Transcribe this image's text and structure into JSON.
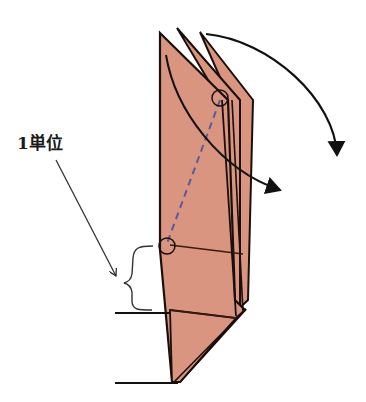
{
  "diagram": {
    "label_unit": "1単位",
    "colors": {
      "paper_fill": "#d99580",
      "paper_stroke": "#1a0f0c",
      "dashed_line": "#5a5a9a",
      "arrow": "#111111",
      "background": "#ffffff"
    },
    "elements": [
      "three folded paper flaps (layered)",
      "curved fold arrow from top flap to right",
      "curved fold arrow crossing flaps",
      "dashed crease line between two circled points",
      "brace marking one unit",
      "pointer arrow from label to brace",
      "horizontal reference lines"
    ]
  }
}
